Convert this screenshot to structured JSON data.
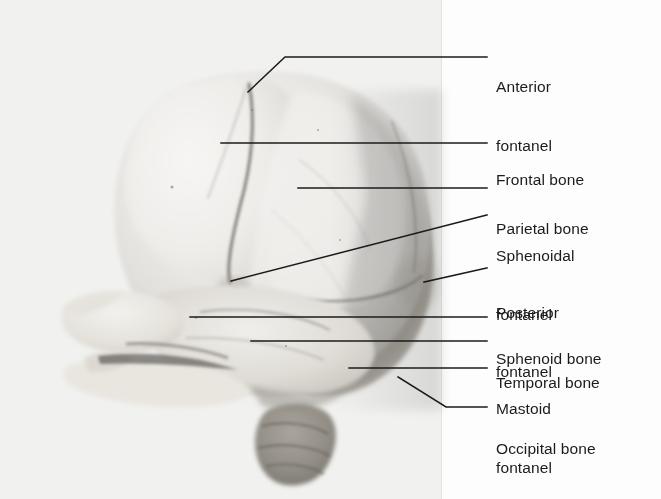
{
  "figure": {
    "view": "lateral (side) view, anterior to the left",
    "medium": "black-and-white photograph",
    "background_color": "#fdfdfd",
    "plate_color": "#f1f1ef",
    "line_color": "#1b1b1b",
    "text_color": "#1b1b1b"
  },
  "labels": [
    {
      "id": "anterior-fontanel",
      "lines": [
        "Anterior",
        "fontanel"
      ],
      "line1": "Anterior",
      "line2": "fontanel",
      "text_x": 496,
      "text_y": 38,
      "leader": "M 248 92 L 285 57 L 487 57",
      "target": "superior frontal/parietal junction at vertex"
    },
    {
      "id": "frontal-bone",
      "lines": [
        "Frontal bone"
      ],
      "line1": "Frontal bone",
      "line2": "",
      "text_x": 496,
      "text_y": 131,
      "leader": "M 221 143 L 487 143",
      "target": "large anterior cranial bone"
    },
    {
      "id": "parietal-bone",
      "lines": [
        "Parietal bone"
      ],
      "line1": "Parietal bone",
      "line2": "",
      "text_x": 496,
      "text_y": 180,
      "leader": "M 298 188 L 487 188",
      "target": "superior lateral cranial bone"
    },
    {
      "id": "sphenoidal-fontanel",
      "lines": [
        "Sphenoidal",
        "fontanel"
      ],
      "line1": "Sphenoidal",
      "line2": "fontanel",
      "text_x": 496,
      "text_y": 207,
      "leader": "M 231 281 L 487 215",
      "target": "anterolateral fontanel at pterion"
    },
    {
      "id": "posterior-fontanel",
      "lines": [
        "Posterior",
        "fontanel"
      ],
      "line1": "Posterior",
      "line2": "fontanel",
      "text_x": 496,
      "text_y": 264,
      "leader": "M 424 282 L 487 268",
      "target": "occipital/parietal junction, posterior"
    },
    {
      "id": "sphenoid-bone",
      "lines": [
        "Sphenoid bone"
      ],
      "line1": "Sphenoid bone",
      "line2": "",
      "text_x": 496,
      "text_y": 310,
      "leader": "M 190 317 L 487 317",
      "target": "greater wing of sphenoid"
    },
    {
      "id": "temporal-bone",
      "lines": [
        "Temporal bone"
      ],
      "line1": "Temporal bone",
      "line2": "",
      "text_x": 496,
      "text_y": 334,
      "leader": "M 251 341 L 487 341",
      "target": "squamous part of temporal bone"
    },
    {
      "id": "mastoid-fontanel",
      "lines": [
        "Mastoid",
        "fontanel"
      ],
      "line1": "Mastoid",
      "line2": "fontanel",
      "text_x": 496,
      "text_y": 360,
      "leader": "M 349 368 L 487 368",
      "target": "posterolateral fontanel at asterion"
    },
    {
      "id": "occipital-bone",
      "lines": [
        "Occipital bone"
      ],
      "line1": "Occipital bone",
      "line2": "",
      "text_x": 496,
      "text_y": 400,
      "leader": "M 398 377 L 446 407 L 487 407",
      "target": "posterior cranial bone"
    }
  ],
  "specimen": {
    "parts": [
      "calvaria",
      "frontal bone",
      "parietal bone",
      "temporal bone",
      "sphenoid bone",
      "occipital bone",
      "maxilla",
      "mandible",
      "cervical vertebrae"
    ],
    "sutures": [
      "coronal suture",
      "squamous suture",
      "lambdoid suture",
      "frontal (metopic) suture"
    ]
  }
}
